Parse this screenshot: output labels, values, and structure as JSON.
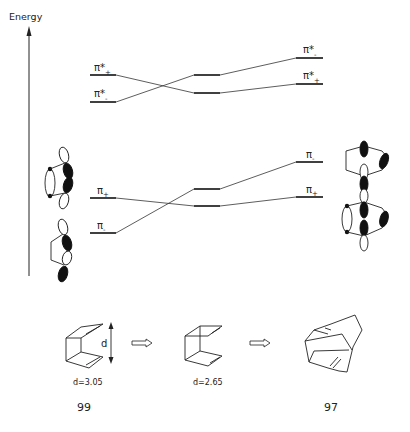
{
  "diagram": {
    "axis": {
      "label": "Energy"
    },
    "levels": {
      "left": {
        "pi_star_plus": {
          "label": "π*",
          "sign": "+"
        },
        "pi_star_minus": {
          "label": "π*",
          "sign": "-"
        },
        "pi_plus": {
          "label": "π",
          "sign": "+"
        },
        "pi_minus": {
          "label": "π",
          "sign": "-"
        }
      },
      "right": {
        "pi_star_minus": {
          "label": "π*",
          "sign": "-"
        },
        "pi_star_plus": {
          "label": "π*",
          "sign": "+"
        },
        "pi_minus": {
          "label": "π",
          "sign": "-"
        },
        "pi_plus": {
          "label": "π",
          "sign": "+"
        }
      }
    },
    "structures": [
      {
        "distance_label": "d",
        "value_label": "d=3.05",
        "compound": "99"
      },
      {
        "value_label": "d=2.65"
      },
      {
        "compound": "97"
      }
    ]
  }
}
